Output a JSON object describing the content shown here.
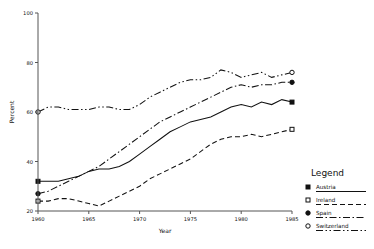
{
  "chart_data": {
    "type": "line",
    "title": "",
    "xlabel": "Year",
    "ylabel": "Percent",
    "xlim": [
      1960,
      1985
    ],
    "ylim": [
      20,
      100
    ],
    "xticks": [
      1960,
      1965,
      1970,
      1975,
      1980,
      1985
    ],
    "yticks": [
      20,
      40,
      60,
      80,
      100
    ],
    "grid": false,
    "legend_position": "right",
    "legend_title": "Legend",
    "x": [
      1960,
      1961,
      1962,
      1963,
      1964,
      1965,
      1966,
      1967,
      1968,
      1969,
      1970,
      1971,
      1972,
      1973,
      1974,
      1975,
      1976,
      1977,
      1978,
      1979,
      1980,
      1981,
      1982,
      1983,
      1984,
      1985
    ],
    "series": [
      {
        "name": "Austria",
        "marker": "filled-square",
        "dash": "solid",
        "values": [
          32,
          32,
          32,
          33,
          34,
          36,
          37,
          37,
          38,
          40,
          43,
          46,
          49,
          52,
          54,
          56,
          57,
          58,
          60,
          62,
          63,
          62,
          64,
          63,
          65,
          64
        ]
      },
      {
        "name": "Ireland",
        "marker": "open-square",
        "dash": "dashed",
        "values": [
          24,
          24,
          25,
          25,
          24,
          23,
          22,
          24,
          26,
          28,
          30,
          33,
          35,
          37,
          39,
          41,
          44,
          47,
          49,
          50,
          50,
          51,
          50,
          51,
          52,
          53
        ]
      },
      {
        "name": "Spain",
        "marker": "filled-circle",
        "dash": "dash-dot",
        "values": [
          27,
          28,
          30,
          32,
          34,
          36,
          38,
          41,
          44,
          47,
          50,
          53,
          56,
          58,
          60,
          62,
          64,
          66,
          68,
          70,
          71,
          70,
          71,
          71,
          72,
          72
        ]
      },
      {
        "name": "Switzerland",
        "marker": "open-circle",
        "dash": "dash-dot-dot",
        "values": [
          60,
          62,
          62,
          61,
          61,
          61,
          62,
          62,
          61,
          61,
          63,
          66,
          68,
          70,
          72,
          73,
          73,
          74,
          77,
          76,
          74,
          75,
          76,
          74,
          75,
          76
        ]
      }
    ]
  },
  "legend": {
    "title": "Legend",
    "items": [
      {
        "label": "Austria",
        "marker": "filled-square"
      },
      {
        "label": "Ireland",
        "marker": "open-square"
      },
      {
        "label": "Spain",
        "marker": "filled-circle"
      },
      {
        "label": "Switzerland",
        "marker": "open-circle"
      }
    ]
  },
  "axes": {
    "y_labels": [
      "100",
      "80",
      "60",
      "40",
      "20"
    ],
    "x_labels": [
      "1960",
      "1965",
      "1970",
      "1975",
      "1980",
      "1985"
    ],
    "y_title": "Percent",
    "x_title": "Year"
  }
}
